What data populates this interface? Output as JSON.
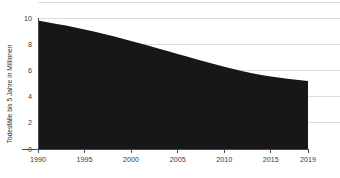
{
  "chart_data": {
    "type": "area",
    "title": "",
    "subtitle": "",
    "xlabel": "",
    "ylabel": "Todesfälle bis 5 Jahre in Millionen",
    "xlim": [
      1990,
      2019
    ],
    "ylim": [
      0,
      10
    ],
    "grid": true,
    "legend": false,
    "legend_position": "none",
    "area_color": "#17171a",
    "gridline_color": "#d9d9d9",
    "axis_color": "#4a4a4a",
    "text_color": "#3a3a3a",
    "background_color": "#ffffff",
    "x_tick_labels": [
      "1990",
      "1995",
      "2000",
      "2005",
      "2010",
      "2015",
      "2019"
    ],
    "x_tick_values": [
      1990,
      1995,
      2000,
      2005,
      2010,
      2015,
      2019
    ],
    "y_tick_labels": [
      "0",
      "2",
      "4",
      "6",
      "8",
      "10"
    ],
    "y_tick_values": [
      0,
      2,
      4,
      6,
      8,
      10
    ],
    "series": [
      {
        "name": "Todesfälle bis 5 Jahre in Millionen",
        "x": [
          1990,
          1991,
          1992,
          1993,
          1994,
          1995,
          1996,
          1997,
          1998,
          1999,
          2000,
          2001,
          2002,
          2003,
          2004,
          2005,
          2006,
          2007,
          2008,
          2009,
          2010,
          2011,
          2012,
          2013,
          2014,
          2015,
          2016,
          2017,
          2018,
          2019
        ],
        "values": [
          9.8,
          9.68,
          9.55,
          9.42,
          9.28,
          9.13,
          8.97,
          8.8,
          8.62,
          8.44,
          8.25,
          8.05,
          7.86,
          7.66,
          7.46,
          7.26,
          7.06,
          6.86,
          6.66,
          6.47,
          6.28,
          6.1,
          5.93,
          5.78,
          5.65,
          5.54,
          5.44,
          5.35,
          5.27,
          5.2
        ]
      }
    ]
  },
  "axis": {
    "y_title": "Todesfälle bis 5 Jahre in Millionen"
  }
}
